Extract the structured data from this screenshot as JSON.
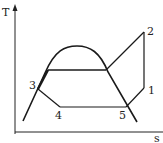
{
  "diagram": {
    "type": "T-s diagram",
    "axes": {
      "y_label": "T",
      "x_label": "s"
    },
    "points": [
      {
        "id": "1",
        "label": "1"
      },
      {
        "id": "2",
        "label": "2"
      },
      {
        "id": "3",
        "label": "3"
      },
      {
        "id": "4",
        "label": "4"
      },
      {
        "id": "5",
        "label": "5"
      }
    ],
    "colors": {
      "line": "#1a1a1a",
      "background": "#ffffff"
    }
  }
}
